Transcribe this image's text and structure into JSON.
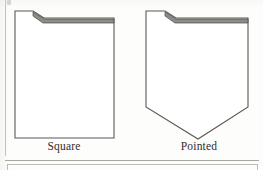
{
  "figure": {
    "kind": "line-drawing",
    "background_color": "#fdfdfb",
    "outline_color": "#5a5955",
    "flap_band_color": "#8d8c88",
    "flap_band_edge_color": "#4a4945",
    "rule_color": "#a9a8a3",
    "caption_color": "#2f2d2b",
    "items": [
      {
        "id": "square",
        "caption": "Square",
        "icon_name": "envelope-square-flap-icon",
        "outline_points": "1,3 19,3 30,10 100,10 100,130 1,130",
        "flap_band_points": "19,4 30,11 100,11 100,15 29,15 19,8",
        "description": "Envelope body with a square bottom and a folded flap across the top."
      },
      {
        "id": "pointed",
        "caption": "Pointed",
        "icon_name": "envelope-pointed-flap-icon",
        "outline_points": "1,3 20,3 31,10 103,10 103,99 53,131 1,99",
        "flap_band_points": "20,4 31,11 103,11 103,15 30,15 20,8",
        "description": "Envelope body with a pointed V bottom and a folded flap across the top."
      }
    ]
  },
  "rules": {
    "left_rule_name": "page-left-rule",
    "bottom_rule_name": "figure-bottom-rule",
    "next_frame_name": "next-figure-frame"
  }
}
